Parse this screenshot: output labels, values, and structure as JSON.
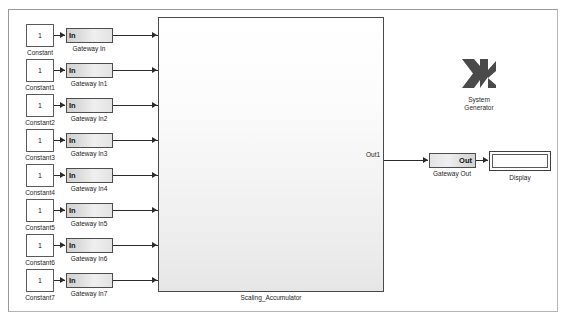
{
  "window": {
    "title": "Scaling_Accumulator model canvas",
    "background": "#ffffff",
    "frame_color": "#9a9a9a"
  },
  "palette": {
    "wire": "#2b2b2b",
    "block_border": "#4d4d4d",
    "gateway_fill_light": "#efefef",
    "gateway_fill_dark": "#d2d2d2",
    "logo_color": "#4a4a4a",
    "text": "#1c1c1c"
  },
  "constants": [
    {
      "value": "1",
      "name": "Constant"
    },
    {
      "value": "1",
      "name": "Constant1"
    },
    {
      "value": "1",
      "name": "Constant2"
    },
    {
      "value": "1",
      "name": "Constant3"
    },
    {
      "value": "1",
      "name": "Constant4"
    },
    {
      "value": "1",
      "name": "Constant5"
    },
    {
      "value": "1",
      "name": "Constant6"
    },
    {
      "value": "1",
      "name": "Constant7"
    }
  ],
  "gateways_in": [
    {
      "label": "In",
      "name": "Gateway In"
    },
    {
      "label": "In",
      "name": "Gateway In1"
    },
    {
      "label": "In",
      "name": "Gateway In2"
    },
    {
      "label": "In",
      "name": "Gateway In3"
    },
    {
      "label": "In",
      "name": "Gateway In4"
    },
    {
      "label": "In",
      "name": "Gateway In5"
    },
    {
      "label": "In",
      "name": "Gateway In6"
    },
    {
      "label": "In",
      "name": "Gateway In7"
    }
  ],
  "subsystem": {
    "name": "Scaling_Accumulator",
    "input_ports": [
      "In1",
      "In2",
      "In3",
      "In4",
      "In5",
      "In6",
      "In7",
      "In8"
    ],
    "output_ports": [
      "Out1"
    ]
  },
  "gateway_out": {
    "label": "Out",
    "name": "Gateway Out"
  },
  "display": {
    "name": "Display",
    "value": ""
  },
  "system_generator": {
    "line1": "System",
    "line2": "Generator",
    "icon": "xilinx-x-logo"
  }
}
